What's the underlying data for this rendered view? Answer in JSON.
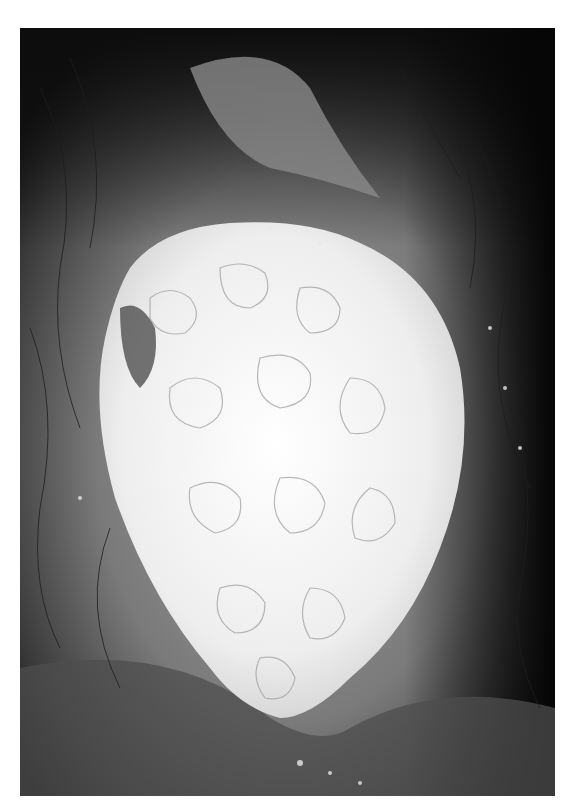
{
  "figure": {
    "type": "grayscale clinical photograph",
    "colors": {
      "page_background": "#ffffff",
      "dark_background": "#141414",
      "skin_mid": "#6e6e6e",
      "skin_light": "#9a9a9a",
      "lesion": "#f2f2f2"
    }
  }
}
